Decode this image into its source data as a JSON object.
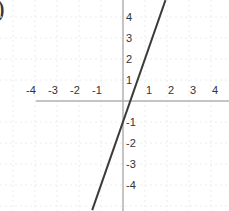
{
  "label_fragment": ")",
  "chart_data": {
    "type": "line",
    "title": "",
    "xlabel": "",
    "ylabel": "",
    "xlim": [
      -5.5,
      4.8
    ],
    "ylim": [
      -5.2,
      4.8
    ],
    "grid": true,
    "x_ticks": [
      -4,
      -3,
      -2,
      -1,
      1,
      2,
      3,
      4
    ],
    "y_ticks": [
      4,
      3,
      2,
      1,
      -1,
      -2,
      -3,
      -4
    ],
    "x_tick_labels": [
      "-4",
      "-3",
      "-2",
      "-1",
      "1",
      "2",
      "3",
      "4"
    ],
    "y_tick_labels": [
      "4",
      "3",
      "2",
      "1",
      "-1",
      "-2",
      "-3",
      "-4"
    ],
    "series": [
      {
        "name": "y = 3x - 1",
        "equation": "y = 3x - 1",
        "slope": 3,
        "intercept": -1,
        "x": [
          -1.4,
          1.93
        ],
        "y": [
          -5.2,
          4.8
        ],
        "color": "#3a3a3a"
      }
    ],
    "axis_color": "#b0b0b0",
    "grid_color": "#ececec",
    "tick_label_color": "#333333"
  }
}
